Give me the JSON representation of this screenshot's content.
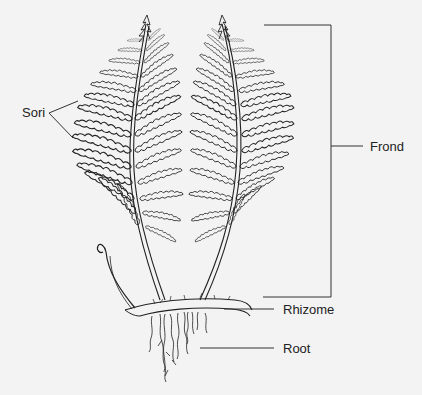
{
  "diagram": {
    "colors": {
      "background": "#f3f3f3",
      "ink": "#222222"
    },
    "labels": {
      "sori": "Sori",
      "frond": "Frond",
      "rhizome": "Rhizome",
      "root": "Root"
    }
  }
}
